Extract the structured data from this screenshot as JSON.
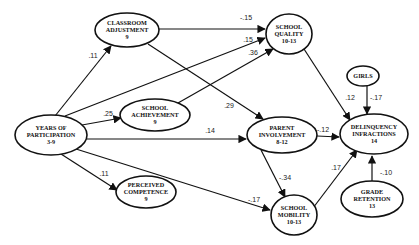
{
  "diagram": {
    "type": "path-model",
    "nodes": [
      {
        "id": "classroom",
        "lines": [
          "CLASSROOM",
          "ADJUSTMENT",
          "9"
        ],
        "cx": 127,
        "cy": 30,
        "rx": 32,
        "ry": 17
      },
      {
        "id": "quality",
        "lines": [
          "SCHOOL",
          "QUALITY",
          "10-13"
        ],
        "cx": 289,
        "cy": 34,
        "rx": 23,
        "ry": 20
      },
      {
        "id": "achievement",
        "lines": [
          "SCHOOL",
          "ACHIEVEMENT",
          "9"
        ],
        "cx": 155,
        "cy": 115,
        "rx": 35,
        "ry": 16
      },
      {
        "id": "parent",
        "lines": [
          "PARENT",
          "INVOLVEMENT",
          "8-12"
        ],
        "cx": 282,
        "cy": 135,
        "rx": 35,
        "ry": 18
      },
      {
        "id": "years",
        "lines": [
          "YEARS OF",
          "PARTICIPATION",
          "3-9"
        ],
        "cx": 51,
        "cy": 135,
        "rx": 36,
        "ry": 20
      },
      {
        "id": "girls",
        "lines": [
          "GIRLS"
        ],
        "cx": 363,
        "cy": 76,
        "rx": 16,
        "ry": 10
      },
      {
        "id": "delinquency",
        "lines": [
          "DELINQUENCY",
          "INFRACTIONS",
          "14"
        ],
        "cx": 374,
        "cy": 134,
        "rx": 34,
        "ry": 20
      },
      {
        "id": "competence",
        "lines": [
          "PERCEIVED",
          "COMPETENCE",
          "9"
        ],
        "cx": 146,
        "cy": 192,
        "rx": 30,
        "ry": 16
      },
      {
        "id": "mobility",
        "lines": [
          "SCHOOL",
          "MOBILITY",
          "10-13"
        ],
        "cx": 294,
        "cy": 215,
        "rx": 23,
        "ry": 20
      },
      {
        "id": "retention",
        "lines": [
          "GRADE",
          "RETENTION",
          "13"
        ],
        "cx": 372,
        "cy": 199,
        "rx": 31,
        "ry": 18
      }
    ],
    "edges": [
      {
        "from": "years",
        "to": "classroom",
        "coef": ".11",
        "x1": 55,
        "y1": 116,
        "x2": 111,
        "y2": 46,
        "lx": 93,
        "ly": 58
      },
      {
        "from": "years",
        "to": "achievement",
        "coef": ".25",
        "x1": 82,
        "y1": 125,
        "x2": 121,
        "y2": 118,
        "lx": 108,
        "ly": 116
      },
      {
        "from": "years",
        "to": "quality",
        "coef": ".15",
        "x1": 65,
        "y1": 116,
        "x2": 265,
        "y2": 38,
        "lx": 248,
        "ly": 42
      },
      {
        "from": "years",
        "to": "parent",
        "coef": ".14",
        "x1": 87,
        "y1": 139,
        "x2": 246,
        "y2": 139,
        "lx": 210,
        "ly": 133
      },
      {
        "from": "years",
        "to": "competence",
        "coef": ".11",
        "x1": 61,
        "y1": 154,
        "x2": 117,
        "y2": 190,
        "lx": 104,
        "ly": 176
      },
      {
        "from": "years",
        "to": "mobility",
        "coef": "-.17",
        "x1": 76,
        "y1": 149,
        "x2": 270,
        "y2": 210,
        "lx": 254,
        "ly": 202
      },
      {
        "from": "classroom",
        "to": "quality",
        "coef": "-.15",
        "x1": 159,
        "y1": 29,
        "x2": 265,
        "y2": 29,
        "lx": 246,
        "ly": 20
      },
      {
        "from": "classroom",
        "to": "parent",
        "coef": ".29",
        "x1": 148,
        "y1": 44,
        "x2": 263,
        "y2": 119,
        "lx": 229,
        "ly": 108
      },
      {
        "from": "achievement",
        "to": "quality",
        "coef": ".36",
        "x1": 178,
        "y1": 103,
        "x2": 273,
        "y2": 49,
        "lx": 253,
        "ly": 55
      },
      {
        "from": "quality",
        "to": "delinquency",
        "coef": ".12",
        "x1": 304,
        "y1": 49,
        "x2": 350,
        "y2": 120,
        "lx": 350,
        "ly": 100
      },
      {
        "from": "girls",
        "to": "delinquency",
        "coef": "-.17",
        "x1": 367,
        "y1": 86,
        "x2": 367,
        "y2": 114,
        "lx": 376,
        "ly": 100
      },
      {
        "from": "parent",
        "to": "delinquency",
        "coef": "-.12",
        "x1": 317,
        "y1": 136,
        "x2": 339,
        "y2": 137,
        "lx": 323,
        "ly": 132
      },
      {
        "from": "parent",
        "to": "mobility",
        "coef": "-.34",
        "x1": 261,
        "y1": 150,
        "x2": 285,
        "y2": 197,
        "lx": 285,
        "ly": 180
      },
      {
        "from": "mobility",
        "to": "delinquency",
        "coef": ".17",
        "x1": 313,
        "y1": 208,
        "x2": 357,
        "y2": 150,
        "lx": 336,
        "ly": 170
      },
      {
        "from": "retention",
        "to": "delinquency",
        "coef": "-.10",
        "x1": 372,
        "y1": 181,
        "x2": 372,
        "y2": 156,
        "lx": 386,
        "ly": 175
      }
    ]
  }
}
